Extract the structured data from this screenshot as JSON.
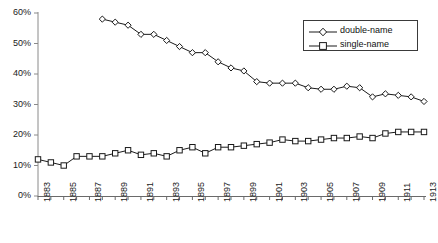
{
  "chart_data": {
    "type": "line",
    "title": "",
    "subtitle": "",
    "xlabel": "",
    "ylabel": "",
    "grid": false,
    "legend_position": "top-right",
    "x": [
      1883,
      1884,
      1885,
      1886,
      1887,
      1888,
      1889,
      1890,
      1891,
      1892,
      1893,
      1894,
      1895,
      1896,
      1897,
      1898,
      1899,
      1900,
      1901,
      1902,
      1903,
      1904,
      1905,
      1906,
      1907,
      1908,
      1909,
      1910,
      1911,
      1912,
      1913
    ],
    "xlim": [
      1883,
      1913
    ],
    "ylim": [
      0,
      60
    ],
    "ytick_labels": [
      "0%",
      "10%",
      "20%",
      "30%",
      "40%",
      "50%",
      "60%"
    ],
    "ytick_values": [
      0,
      10,
      20,
      30,
      40,
      50,
      60
    ],
    "xtick_labels": [
      "1883",
      "1885",
      "1887",
      "1889",
      "1891",
      "1893",
      "1895",
      "1897",
      "1899",
      "1901",
      "1903",
      "1905",
      "1907",
      "1909",
      "1911",
      "1913"
    ],
    "xtick_label_values": [
      1883,
      1885,
      1887,
      1889,
      1891,
      1893,
      1895,
      1897,
      1899,
      1901,
      1903,
      1905,
      1907,
      1909,
      1911,
      1913
    ],
    "series": [
      {
        "name": "double-name",
        "marker": "diamond",
        "color": "#1a1a1a",
        "x": [
          1888,
          1889,
          1890,
          1891,
          1892,
          1893,
          1894,
          1895,
          1896,
          1897,
          1898,
          1899,
          1900,
          1901,
          1902,
          1903,
          1904,
          1905,
          1906,
          1907,
          1908,
          1909,
          1910,
          1911,
          1912,
          1913
        ],
        "values": [
          58.0,
          57.0,
          56.0,
          53.0,
          53.0,
          51.0,
          49.0,
          47.0,
          47.0,
          44.0,
          42.0,
          41.0,
          37.5,
          37.0,
          37.0,
          37.0,
          35.5,
          35.0,
          35.0,
          36.0,
          35.5,
          32.5,
          33.5,
          33.0,
          32.5,
          31.0
        ]
      },
      {
        "name": "single-name",
        "marker": "square",
        "color": "#1a1a1a",
        "x": [
          1883,
          1884,
          1885,
          1886,
          1887,
          1888,
          1889,
          1890,
          1891,
          1892,
          1893,
          1894,
          1895,
          1896,
          1897,
          1898,
          1899,
          1900,
          1901,
          1902,
          1903,
          1904,
          1905,
          1906,
          1907,
          1908,
          1909,
          1910,
          1911,
          1912,
          1913
        ],
        "values": [
          12.0,
          11.0,
          10.0,
          13.0,
          13.0,
          13.0,
          14.0,
          15.0,
          13.5,
          14.0,
          13.0,
          15.0,
          16.0,
          14.0,
          16.0,
          16.0,
          16.5,
          17.0,
          17.5,
          18.5,
          18.0,
          18.0,
          18.5,
          19.0,
          19.0,
          19.5,
          19.0,
          20.5,
          21.0,
          21.0,
          21.0
        ]
      }
    ]
  },
  "legend": {
    "items": [
      {
        "label": "double-name",
        "marker": "diamond"
      },
      {
        "label": "single-name",
        "marker": "square"
      }
    ]
  }
}
